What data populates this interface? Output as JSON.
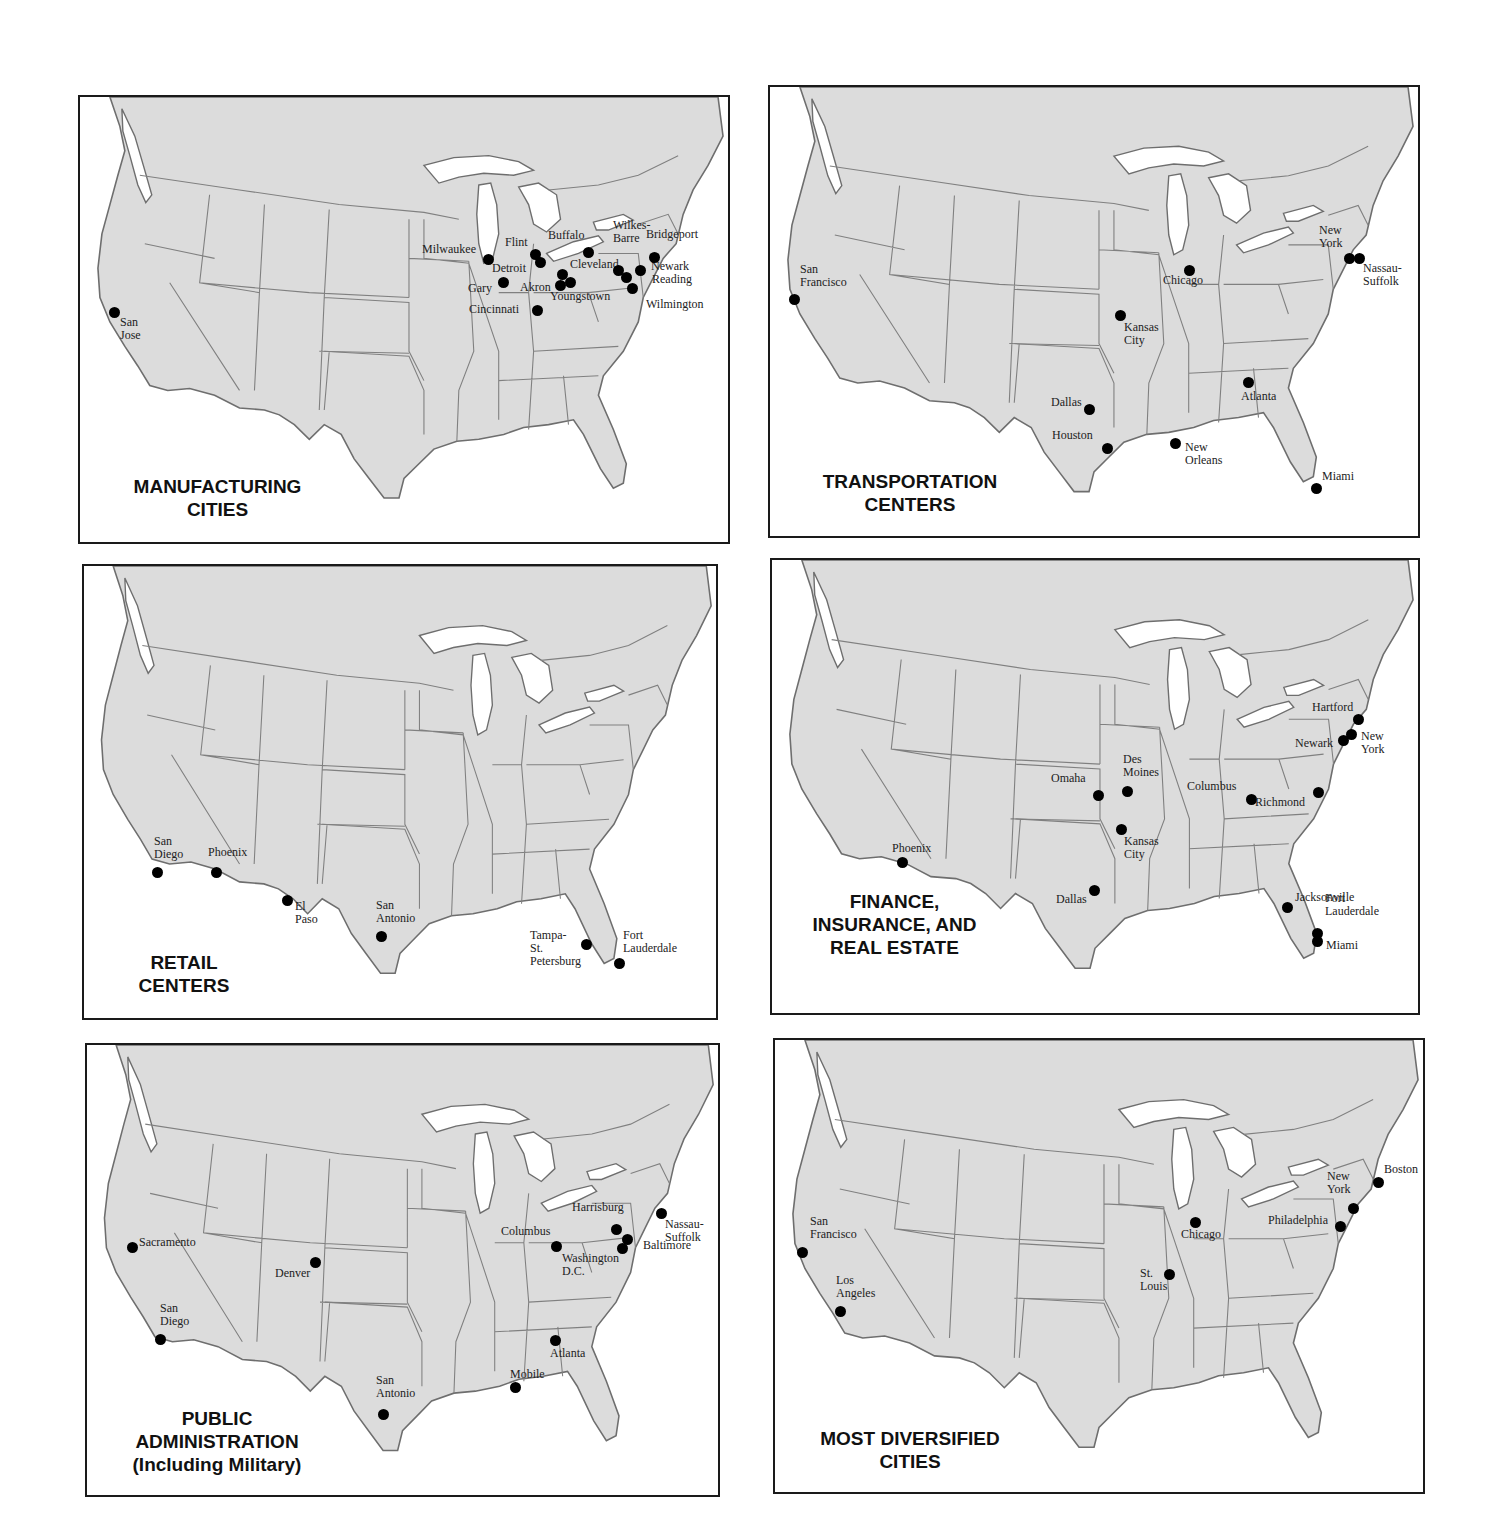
{
  "colors": {
    "land": "#dcdcdc",
    "water": "#ffffff",
    "dot": "#000000",
    "frame": "#1a1a1a"
  },
  "panels": [
    {
      "id": "manufacturing",
      "title": "MANUFACTURING\nCITIES",
      "box": {
        "left": 78,
        "top": 95,
        "width": 652,
        "height": 449
      },
      "title_pos": {
        "left": 20,
        "top": 378,
        "width": 235
      },
      "cities": [
        {
          "name": "San Jose",
          "x": 34,
          "y": 215,
          "lx": 6,
          "ly": 4
        },
        {
          "name": "Milwaukee",
          "x": 408,
          "y": 162,
          "lx": -66,
          "ly": -16
        },
        {
          "name": "Gary",
          "x": 423,
          "y": 185,
          "lx": -35,
          "ly": 0
        },
        {
          "name": "Flint",
          "x": 455,
          "y": 157,
          "lx": -30,
          "ly": -18
        },
        {
          "name": "Detroit",
          "x": 460,
          "y": 165,
          "lx": -48,
          "ly": 0
        },
        {
          "name": "Cincinnati",
          "x": 457,
          "y": 213,
          "lx": -68,
          "ly": -7
        },
        {
          "name": "Akron",
          "x": 480,
          "y": 188,
          "lx": -40,
          "ly": -4
        },
        {
          "name": "Cleveland",
          "x": 482,
          "y": 177,
          "lx": 8,
          "ly": -16
        },
        {
          "name": "Youngstown",
          "x": 490,
          "y": 185,
          "lx": -20,
          "ly": 8
        },
        {
          "name": "Buffalo",
          "x": 508,
          "y": 155,
          "lx": -40,
          "ly": -23
        },
        {
          "name": "Wilkes-\nBarre",
          "x": 538,
          "y": 173,
          "lx": -5,
          "ly": -51
        },
        {
          "name": "Newark",
          "x": 560,
          "y": 173,
          "lx": 11,
          "ly": -10
        },
        {
          "name": "Reading",
          "x": 546,
          "y": 180,
          "lx": 26,
          "ly": -4
        },
        {
          "name": "Wilmington",
          "x": 552,
          "y": 191,
          "lx": 14,
          "ly": 10
        },
        {
          "name": "Bridgeport",
          "x": 574,
          "y": 160,
          "lx": -8,
          "ly": -29
        }
      ]
    },
    {
      "id": "transportation",
      "title": "TRANSPORTATION\nCENTERS",
      "box": {
        "left": 768,
        "top": 85,
        "width": 652,
        "height": 453
      },
      "title_pos": {
        "left": 30,
        "top": 383,
        "width": 220
      },
      "cities": [
        {
          "name": "San\nFrancisco",
          "x": 24,
          "y": 212,
          "lx": 6,
          "ly": -36
        },
        {
          "name": "Kansas\nCity",
          "x": 350,
          "y": 228,
          "lx": 4,
          "ly": 6
        },
        {
          "name": "Chicago",
          "x": 419,
          "y": 183,
          "lx": -26,
          "ly": 4
        },
        {
          "name": "New\nYork",
          "x": 579,
          "y": 171,
          "lx": -30,
          "ly": -34
        },
        {
          "name": "Nassau-\nSuffolk",
          "x": 589,
          "y": 171,
          "lx": 4,
          "ly": 4
        },
        {
          "name": "Atlanta",
          "x": 478,
          "y": 295,
          "lx": -7,
          "ly": 8
        },
        {
          "name": "Dallas",
          "x": 319,
          "y": 322,
          "lx": -38,
          "ly": -13
        },
        {
          "name": "Houston",
          "x": 337,
          "y": 361,
          "lx": -55,
          "ly": -19
        },
        {
          "name": "New\nOrleans",
          "x": 405,
          "y": 356,
          "lx": 10,
          "ly": -2
        },
        {
          "name": "Miami",
          "x": 546,
          "y": 401,
          "lx": 6,
          "ly": -18
        }
      ]
    },
    {
      "id": "retail",
      "title": "RETAIL\nCENTERS",
      "box": {
        "left": 82,
        "top": 564,
        "width": 636,
        "height": 456
      },
      "title_pos": {
        "left": 30,
        "top": 385,
        "width": 140
      },
      "cities": [
        {
          "name": "San\nDiego",
          "x": 73,
          "y": 306,
          "lx": -3,
          "ly": -37
        },
        {
          "name": "Phoenix",
          "x": 132,
          "y": 306,
          "lx": -8,
          "ly": -26
        },
        {
          "name": "El Paso",
          "x": 203,
          "y": 334,
          "lx": 8,
          "ly": 0
        },
        {
          "name": "San\nAntonio",
          "x": 297,
          "y": 370,
          "lx": -5,
          "ly": -37
        },
        {
          "name": "Tampa-\nSt. Petersburg",
          "x": 502,
          "y": 378,
          "lx": -56,
          "ly": -15
        },
        {
          "name": "Fort\nLauderdale",
          "x": 535,
          "y": 397,
          "lx": 4,
          "ly": -34
        }
      ]
    },
    {
      "id": "finance",
      "title": "FINANCE,\nINSURANCE, AND\nREAL ESTATE",
      "box": {
        "left": 770,
        "top": 558,
        "width": 650,
        "height": 457
      },
      "title_pos": {
        "left": 10,
        "top": 330,
        "width": 225
      },
      "cities": [
        {
          "name": "Phoenix",
          "x": 130,
          "y": 302,
          "lx": -10,
          "ly": -20
        },
        {
          "name": "Dallas",
          "x": 322,
          "y": 330,
          "lx": -38,
          "ly": 3
        },
        {
          "name": "Omaha",
          "x": 326,
          "y": 235,
          "lx": -47,
          "ly": -23
        },
        {
          "name": "Des\nMoines",
          "x": 355,
          "y": 231,
          "lx": -4,
          "ly": -38
        },
        {
          "name": "Kansas\nCity",
          "x": 349,
          "y": 269,
          "lx": 3,
          "ly": 6
        },
        {
          "name": "Columbus",
          "x": 479,
          "y": 239,
          "lx": -64,
          "ly": -19
        },
        {
          "name": "Richmond",
          "x": 546,
          "y": 232,
          "lx": -63,
          "ly": 4
        },
        {
          "name": "Hartford",
          "x": 586,
          "y": 159,
          "lx": -46,
          "ly": -18
        },
        {
          "name": "Newark",
          "x": 571,
          "y": 180,
          "lx": -48,
          "ly": -3
        },
        {
          "name": "New York",
          "x": 579,
          "y": 174,
          "lx": 10,
          "ly": -4
        },
        {
          "name": "Jacksonville",
          "x": 515,
          "y": 347,
          "lx": 8,
          "ly": -16
        },
        {
          "name": "Fort\nLauderdale",
          "x": 545,
          "y": 373,
          "lx": 8,
          "ly": -41
        },
        {
          "name": "Miami",
          "x": 545,
          "y": 381,
          "lx": 9,
          "ly": -2
        }
      ]
    },
    {
      "id": "public-admin",
      "title": "PUBLIC\nADMINISTRATION\n(Including Military)",
      "box": {
        "left": 85,
        "top": 1043,
        "width": 635,
        "height": 454
      },
      "title_pos": {
        "left": 25,
        "top": 362,
        "width": 210
      },
      "cities": [
        {
          "name": "Sacramento",
          "x": 45,
          "y": 202,
          "lx": 7,
          "ly": -11
        },
        {
          "name": "Denver",
          "x": 228,
          "y": 217,
          "lx": -40,
          "ly": 5
        },
        {
          "name": "San\nDiego",
          "x": 73,
          "y": 294,
          "lx": 0,
          "ly": -37
        },
        {
          "name": "San\nAntonio",
          "x": 296,
          "y": 369,
          "lx": -7,
          "ly": -40
        },
        {
          "name": "Columbus",
          "x": 469,
          "y": 201,
          "lx": -55,
          "ly": -21
        },
        {
          "name": "Harrisburg",
          "x": 529,
          "y": 184,
          "lx": -44,
          "ly": -28
        },
        {
          "name": "Baltimore",
          "x": 540,
          "y": 194,
          "lx": 16,
          "ly": 0
        },
        {
          "name": "Washington\nD.C.",
          "x": 535,
          "y": 203,
          "lx": -60,
          "ly": 4
        },
        {
          "name": "Nassau-\nSuffolk",
          "x": 574,
          "y": 168,
          "lx": 4,
          "ly": 5
        },
        {
          "name": "Atlanta",
          "x": 468,
          "y": 295,
          "lx": -5,
          "ly": 7
        },
        {
          "name": "Mobile",
          "x": 428,
          "y": 342,
          "lx": -5,
          "ly": -19
        }
      ]
    },
    {
      "id": "diversified",
      "title": "MOST DIVERSIFIED\nCITIES",
      "box": {
        "left": 773,
        "top": 1038,
        "width": 652,
        "height": 456
      },
      "title_pos": {
        "left": 20,
        "top": 387,
        "width": 230
      },
      "cities": [
        {
          "name": "San\nFrancisco",
          "x": 27,
          "y": 212,
          "lx": 8,
          "ly": -37
        },
        {
          "name": "Los\nAngeles",
          "x": 65,
          "y": 271,
          "lx": -4,
          "ly": -37
        },
        {
          "name": "Chicago",
          "x": 420,
          "y": 182,
          "lx": -14,
          "ly": 6
        },
        {
          "name": "St.\nLouis",
          "x": 394,
          "y": 234,
          "lx": -29,
          "ly": -7
        },
        {
          "name": "Philadelphia",
          "x": 565,
          "y": 186,
          "lx": -72,
          "ly": -12
        },
        {
          "name": "New\nYork",
          "x": 578,
          "y": 168,
          "lx": -26,
          "ly": -38
        },
        {
          "name": "Boston",
          "x": 603,
          "y": 142,
          "lx": 6,
          "ly": -19
        }
      ]
    }
  ]
}
